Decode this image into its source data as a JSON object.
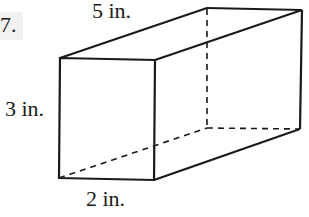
{
  "problem": {
    "number": "7."
  },
  "figure": {
    "type": "rectangular prism",
    "dimensions": {
      "length": "5 in.",
      "height": "3 in.",
      "width": "2 in."
    },
    "stroke_color": "#1a1a1a"
  }
}
